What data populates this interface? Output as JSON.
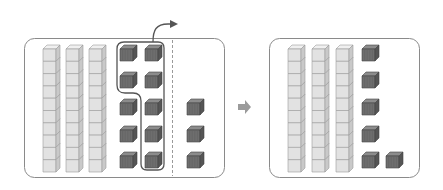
{
  "diagram": {
    "colors": {
      "panel_border": "#8a8a8a",
      "rod_front": "#e2e2e2",
      "rod_top": "#f0f0f0",
      "rod_side": "#c9c9c9",
      "rod_line": "#9a9a9a",
      "unit_front": "#6e6e6e",
      "unit_top": "#8c8c8c",
      "unit_side": "#555555",
      "arrow": "#555555",
      "transition_arrow": "#9b9b9b",
      "selection_outline": "#555555",
      "divider": "#9a9a9a"
    },
    "before_panel": {
      "tens_rods": 3,
      "unit_cubes_left_group": 10,
      "unit_cubes_removed": 7,
      "unit_cubes_right_of_divider": 3
    },
    "after_panel": {
      "tens_rods": 3,
      "unit_cubes": 6
    }
  }
}
